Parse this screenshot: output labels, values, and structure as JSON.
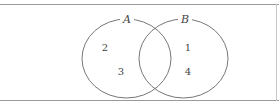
{
  "diagram": {
    "type": "venn",
    "sets": [
      {
        "name": "A",
        "elements_only": [
          "2",
          "3"
        ]
      },
      {
        "name": "B",
        "elements_only": [
          "1",
          "4"
        ]
      }
    ],
    "intersection": [],
    "colors": {
      "stroke": "#666666",
      "frame": "#9a9a9a",
      "text": "#444444"
    }
  }
}
